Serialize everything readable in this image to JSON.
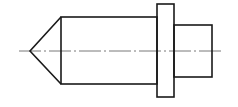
{
  "diagram": {
    "type": "technical-drawing",
    "colors": {
      "outline": "#1a1a1a",
      "centerline": "#555555",
      "background": "#ffffff"
    },
    "parts": [
      {
        "name": "conical-tip",
        "tip": [
          30,
          51
        ],
        "base_x": 61,
        "base_y": [
          17,
          84
        ]
      },
      {
        "name": "main-cylinder",
        "x": [
          61,
          157
        ],
        "y": [
          17,
          84
        ]
      },
      {
        "name": "flange",
        "x": [
          157,
          174
        ],
        "y": [
          4,
          97
        ]
      },
      {
        "name": "small-cylinder",
        "x": [
          174,
          212
        ],
        "y": [
          25,
          77
        ]
      }
    ],
    "centerline": {
      "y": 51,
      "x": [
        19,
        222
      ],
      "style": "dash-dot"
    }
  }
}
